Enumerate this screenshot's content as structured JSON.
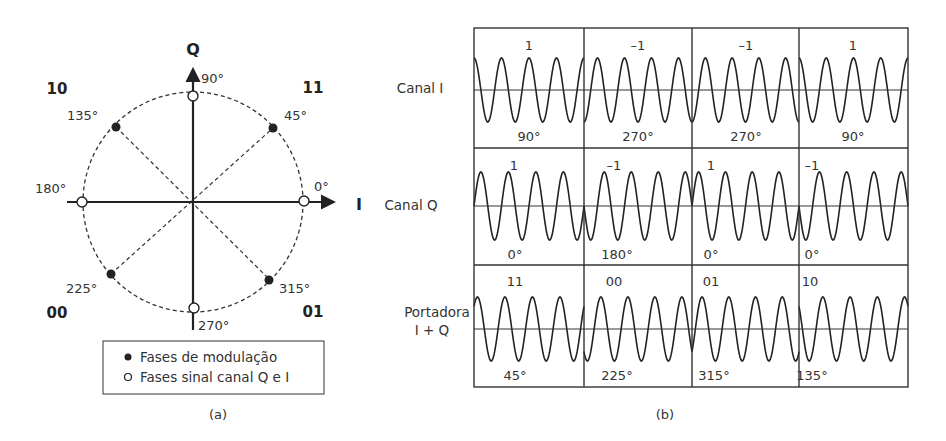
{
  "panel_a": {
    "caption": "(a)",
    "axes": {
      "q_label": "Q",
      "i_label": "I"
    },
    "quadrant_codes": {
      "top_left": "10",
      "top_right": "11",
      "bottom_left": "00",
      "bottom_right": "01"
    },
    "axis_phase_labels": {
      "p0": "0°",
      "p90": "90°",
      "p180": "180°",
      "p270": "270°"
    },
    "modulation_phase_labels": {
      "p45": "45°",
      "p135": "135°",
      "p225": "225°",
      "p315": "315°"
    },
    "legend": {
      "filled": "Fases de modulação",
      "hollow": "Fases sinal canal Q e I"
    },
    "colors": {
      "ink": "#222222",
      "background": "#ffffff"
    }
  },
  "panel_b": {
    "caption": "(b)",
    "rows": [
      {
        "label_line1": "Canal I",
        "label_line2": "",
        "cells": [
          {
            "top": "1",
            "bottom": "90°",
            "phase_deg": 90
          },
          {
            "top": "–1",
            "bottom": "270°",
            "phase_deg": 270
          },
          {
            "top": "–1",
            "bottom": "270°",
            "phase_deg": 270
          },
          {
            "top": "1",
            "bottom": "90°",
            "phase_deg": 90
          }
        ]
      },
      {
        "label_line1": "Canal Q",
        "label_line2": "",
        "cells": [
          {
            "top": "1",
            "bottom": "0°",
            "phase_deg": 0
          },
          {
            "top": "–1",
            "bottom": "180°",
            "phase_deg": 180
          },
          {
            "top": "1",
            "bottom": "0°",
            "phase_deg": 0
          },
          {
            "top": "–1",
            "bottom": "0°",
            "phase_deg": 180
          }
        ]
      },
      {
        "label_line1": "Portadora",
        "label_line2": "I + Q",
        "cells": [
          {
            "top": "11",
            "bottom": "45°",
            "phase_deg": 45
          },
          {
            "top": "00",
            "bottom": "225°",
            "phase_deg": 225
          },
          {
            "top": "01",
            "bottom": "315°",
            "phase_deg": 315
          },
          {
            "top": "10",
            "bottom": "135°",
            "phase_deg": 135
          }
        ]
      }
    ]
  }
}
